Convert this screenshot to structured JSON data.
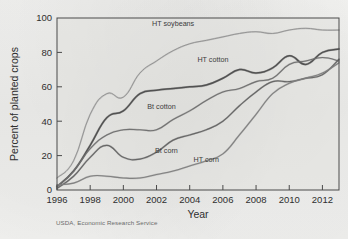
{
  "figure": {
    "source_note": "USDA, Economic Research Service",
    "xlabel": "Year",
    "ylabel": "Percent of planted crops"
  },
  "chart_data": {
    "type": "line",
    "title": "",
    "xlabel": "Year",
    "ylabel": "Percent of planted crops",
    "xlim": [
      1996,
      2013
    ],
    "ylim": [
      0,
      100
    ],
    "xticks": [
      1996,
      1998,
      2000,
      2002,
      2004,
      2006,
      2008,
      2010,
      2012
    ],
    "yticks": [
      0,
      20,
      40,
      60,
      80,
      100
    ],
    "grid": false,
    "legend": "inline-labels",
    "x": [
      1996,
      1997,
      1998,
      1999,
      2000,
      2001,
      2002,
      2003,
      2004,
      2005,
      2006,
      2007,
      2008,
      2009,
      2010,
      2011,
      2012,
      2013
    ],
    "series": [
      {
        "name": "HT soybeans",
        "color": "#8d8d8d",
        "width": 0.9,
        "label_x": 2003.0,
        "label_y": 95.5,
        "values": [
          7,
          17,
          44,
          56,
          54,
          68,
          75,
          81,
          85,
          87,
          89,
          91,
          92,
          91,
          93,
          94,
          93,
          93
        ]
      },
      {
        "name": "HT cotton",
        "color": "#4d4d4d",
        "width": 1.5,
        "label_x": 2005.4,
        "label_y": 74.5,
        "values": [
          2,
          11,
          26,
          42,
          46,
          56,
          58,
          59,
          60,
          61,
          65,
          70,
          68,
          71,
          78,
          73,
          80,
          82
        ]
      },
      {
        "name": "Bt cotton",
        "color": "#6e6e6e",
        "width": 1.1,
        "label_x": 2002.3,
        "label_y": 47.0,
        "values": [
          2,
          11,
          24,
          32,
          35,
          35,
          35,
          41,
          46,
          52,
          57,
          59,
          63,
          65,
          73,
          75,
          77,
          75
        ]
      },
      {
        "name": "Bt corn",
        "color": "#636363",
        "width": 1.2,
        "label_x": 2002.6,
        "label_y": 21.5,
        "values": [
          1,
          8,
          19,
          26,
          19,
          18,
          22,
          29,
          32,
          35,
          40,
          49,
          57,
          63,
          63,
          65,
          67,
          76
        ]
      },
      {
        "name": "HT corn",
        "color": "#7d7d7d",
        "width": 1.1,
        "label_x": 2005.0,
        "label_y": 16.5,
        "values": [
          3,
          4,
          8,
          8,
          7,
          7,
          9,
          11,
          14,
          17,
          21,
          32,
          44,
          56,
          62,
          65,
          68,
          74
        ]
      }
    ]
  }
}
